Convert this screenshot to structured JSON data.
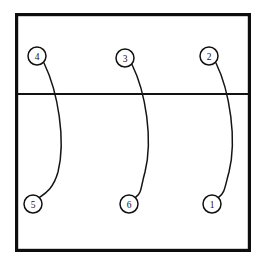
{
  "figure": {
    "type": "technical-line-diagram",
    "background_color": "#ffffff",
    "line_color": "#111111",
    "width": 266,
    "height": 274
  },
  "frame": {
    "name": "outer-rectangle",
    "x": 15,
    "y": 13,
    "width": 236,
    "height": 239,
    "stroke_width": 3.2,
    "color": "#0d0d0d"
  },
  "divider": {
    "name": "horizontal-partition-line",
    "x1": 15,
    "y1": 94,
    "x2": 251,
    "y2": 94,
    "stroke_width": 2.2,
    "color": "#121212"
  },
  "nodes": [
    {
      "id": "node-4",
      "label": "4",
      "cx": 37,
      "cy": 56,
      "r": 9,
      "region": "upper"
    },
    {
      "id": "node-3",
      "label": "3",
      "cx": 125,
      "cy": 58,
      "r": 9,
      "region": "upper"
    },
    {
      "id": "node-2",
      "label": "2",
      "cx": 209,
      "cy": 56,
      "r": 9,
      "region": "upper"
    },
    {
      "id": "node-5",
      "label": "5",
      "cx": 33,
      "cy": 204,
      "r": 9,
      "region": "lower"
    },
    {
      "id": "node-6",
      "label": "6",
      "cx": 129,
      "cy": 204,
      "r": 9,
      "region": "lower"
    },
    {
      "id": "node-1",
      "label": "1",
      "cx": 212,
      "cy": 204,
      "r": 9,
      "region": "lower"
    }
  ],
  "connectors": [
    {
      "id": "connector-4-5",
      "from": "node-4",
      "to": "node-5",
      "path": "M 44.0 63.0 C 58.0 92.0 66.0 140.0 58.0 172.0 C 53.5 188.0 46.0 193.0 39.8 197.2"
    },
    {
      "id": "connector-3-6",
      "from": "node-3",
      "to": "node-6",
      "path": "M 132.0 64.5 C 146.0 93.0 153.0 140.0 145.0 172.0 C 140.5 188.0 142.0 192.5 135.8 197.2"
    },
    {
      "id": "connector-2-1",
      "from": "node-2",
      "to": "node-1",
      "path": "M 216.0 63.0 C 230.0 92.0 237.0 140.0 229.0 172.0 C 224.5 188.0 225.0 192.5 218.8 197.2"
    }
  ]
}
